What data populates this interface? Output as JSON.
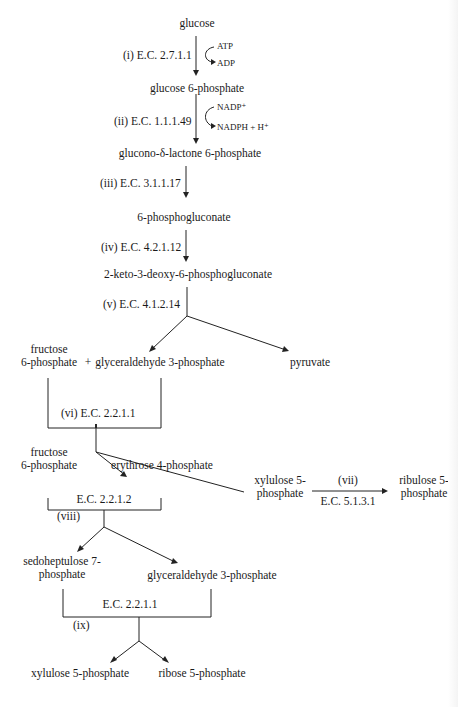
{
  "diagram": {
    "title": "",
    "nodes": {
      "glucose": "glucose",
      "glucose_6_phosphate": "glucose 6-phosphate",
      "glucono_lactone": "glucono-δ-lactone 6-phosphate",
      "phosphogluconate": "6-phosphogluconate",
      "kdpg": "2-keto-3-deoxy-6-phosphogluconate",
      "fructose_6p_a_line1": "fructose",
      "fructose_6p_a_line2": "6-phosphate",
      "plus": "+",
      "g3p_a": "glyceraldehyde 3-phosphate",
      "pyruvate": "pyruvate",
      "fructose_6p_b_line1": "fructose",
      "fructose_6p_b_line2": "6-phosphate",
      "erythrose_4p": "erythrose 4-phosphate",
      "xylulose_5p_a_line1": "xylulose 5-",
      "xylulose_5p_a_line2": "phosphate",
      "ribulose_5p_line1": "ribulose 5-",
      "ribulose_5p_line2": "phosphate",
      "sedoheptulose_7p_line1": "sedoheptulose 7-",
      "sedoheptulose_7p_line2": "phosphate",
      "g3p_b": "glyceraldehyde 3-phosphate",
      "xylulose_5p_b": "xylulose 5-phosphate",
      "ribose_5p": "ribose 5-phosphate"
    },
    "enzymes": {
      "i": "(i) E.C. 2.7.1.1",
      "ii": "(ii) E.C. 1.1.1.49",
      "iii": "(iii) E.C. 3.1.1.17",
      "iv": "(iv) E.C. 4.2.1.12",
      "v": "(v) E.C. 4.1.2.14",
      "vi": "(vi) E.C. 2.2.1.1",
      "vii_num": "(vii)",
      "vii_ec": "E.C. 5.1.3.1",
      "viii_ec": "E.C. 2.2.1.2",
      "viii_num": "(viii)",
      "ix_ec": "E.C. 2.2.1.1",
      "ix_num": "(ix)"
    },
    "cofactors": {
      "atp": "ATP",
      "adp": "ADP",
      "nadp": "NADP⁺",
      "nadph": "NADPH + H⁺"
    }
  }
}
